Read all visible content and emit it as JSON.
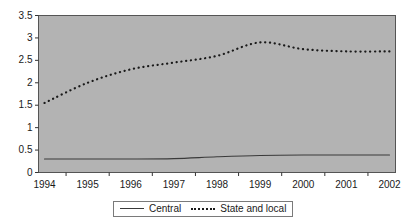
{
  "chart_data": {
    "type": "line",
    "title": "",
    "xlabel": "",
    "ylabel": "",
    "categories": [
      "1994",
      "1995",
      "1996",
      "1997",
      "1998",
      "1999",
      "2000",
      "2001",
      "2002"
    ],
    "x": [
      1994,
      1995,
      1996,
      1997,
      1998,
      1999,
      2000,
      2001,
      2002
    ],
    "ylim": [
      0,
      3.5
    ],
    "xlim": [
      1993.7,
      2002.3
    ],
    "yticks": [
      0,
      0.5,
      1,
      1.5,
      2,
      2.5,
      3,
      3.5
    ],
    "ytick_labels": [
      "0",
      "0.5",
      "1",
      "1.5",
      "2",
      "2.5",
      "3",
      "3.5"
    ],
    "grid": false,
    "legend_position": "bottom",
    "plot_background": "#b3b3b3",
    "series": [
      {
        "name": "Central",
        "style": "solid",
        "color": "#3a3a3a",
        "values": [
          0.3,
          0.3,
          0.3,
          0.31,
          0.35,
          0.38,
          0.39,
          0.39,
          0.39
        ]
      },
      {
        "name": "State and local",
        "style": "dotted",
        "color": "#1a1a1a",
        "values": [
          1.55,
          2.0,
          2.3,
          2.45,
          2.6,
          2.9,
          2.75,
          2.7,
          2.7
        ]
      }
    ]
  },
  "legend": {
    "entries": [
      {
        "label": "Central",
        "style": "solid"
      },
      {
        "label": "State and local",
        "style": "dotted"
      }
    ]
  }
}
